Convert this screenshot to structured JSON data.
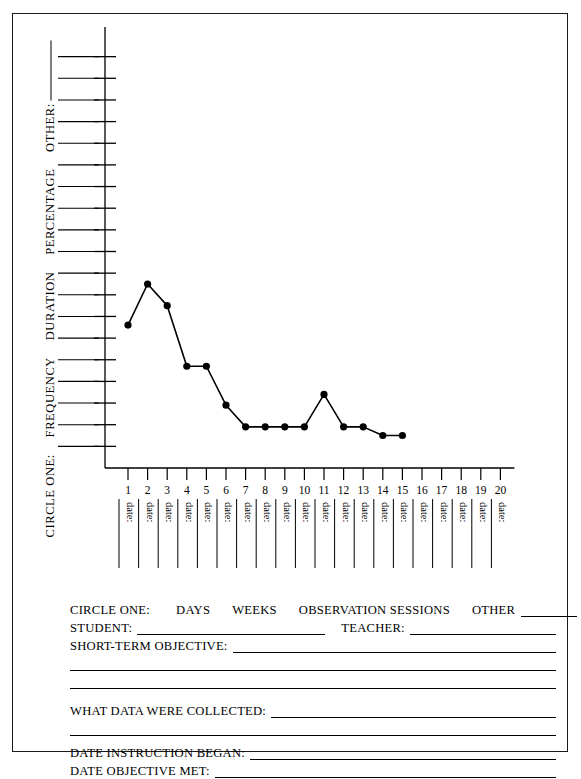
{
  "document": {
    "title": "Data Collection Graph Form",
    "border_color": "#1a1a1a"
  },
  "y_axis_caption": {
    "prefix": "CIRCLE ONE:",
    "options": [
      "FREQUENCY",
      "DURATION",
      "PERCENTAGE"
    ],
    "other_label": "OTHER:"
  },
  "x_axis": {
    "tick_labels": [
      "1",
      "2",
      "3",
      "4",
      "5",
      "6",
      "7",
      "8",
      "9",
      "10",
      "11",
      "12",
      "13",
      "14",
      "15",
      "16",
      "17",
      "18",
      "19",
      "20"
    ],
    "date_label": "date:"
  },
  "form": {
    "circle_one_label": "CIRCLE ONE:",
    "circle_one_options": [
      "DAYS",
      "WEEKS",
      "OBSERVATION SESSIONS",
      "OTHER"
    ],
    "student_label": "STUDENT:",
    "teacher_label": "TEACHER:",
    "short_term_objective_label": "SHORT-TERM OBJECTIVE:",
    "what_data_label": "WHAT DATA WERE COLLECTED:",
    "date_began_label": "DATE INSTRUCTION BEGAN:",
    "date_met_label": "DATE OBJECTIVE MET:"
  },
  "chart_data": {
    "type": "line",
    "title": "",
    "xlabel": "",
    "ylabel": "",
    "grid": false,
    "legend": "none",
    "x": [
      1,
      2,
      3,
      4,
      5,
      6,
      7,
      8,
      9,
      10,
      11,
      12,
      13,
      14,
      15
    ],
    "values": [
      6.6,
      8.5,
      7.5,
      4.7,
      4.7,
      2.9,
      1.9,
      1.9,
      1.9,
      1.9,
      3.4,
      1.9,
      1.9,
      1.5,
      1.5
    ],
    "xlim": [
      0,
      21
    ],
    "ylim": [
      0,
      20
    ],
    "y_tick_count": 20,
    "marker": "filled-circle",
    "line_color": "#000000",
    "marker_color": "#000000"
  }
}
